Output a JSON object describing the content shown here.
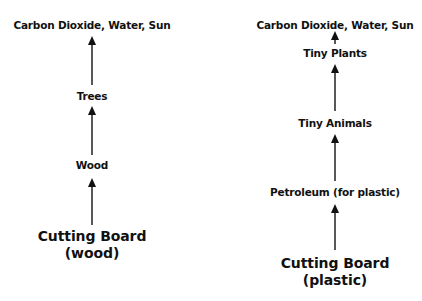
{
  "diagram": {
    "type": "flow",
    "direction": "bottom-to-top",
    "left_chain": {
      "nodes": [
        {
          "id": "co2",
          "label": "Carbon Dioxide, Water, Sun"
        },
        {
          "id": "trees",
          "label": "Trees"
        },
        {
          "id": "wood",
          "label": "Wood"
        },
        {
          "id": "board",
          "label_line1": "Cutting Board",
          "label_line2": "(wood)"
        }
      ],
      "edges": [
        {
          "from": "board",
          "to": "wood"
        },
        {
          "from": "wood",
          "to": "trees"
        },
        {
          "from": "trees",
          "to": "co2"
        }
      ]
    },
    "right_chain": {
      "nodes": [
        {
          "id": "co2",
          "label": "Carbon Dioxide, Water, Sun"
        },
        {
          "id": "plants",
          "label": "Tiny Plants"
        },
        {
          "id": "animals",
          "label": "Tiny Animals"
        },
        {
          "id": "petroleum",
          "label": "Petroleum (for plastic)"
        },
        {
          "id": "board",
          "label_line1": "Cutting Board",
          "label_line2": "(plastic)"
        }
      ],
      "edges": [
        {
          "from": "board",
          "to": "petroleum"
        },
        {
          "from": "petroleum",
          "to": "animals"
        },
        {
          "from": "animals",
          "to": "plants"
        },
        {
          "from": "plants",
          "to": "co2"
        }
      ]
    },
    "colors": {
      "text": "#111111",
      "arrow": "#111111",
      "background": "#ffffff"
    }
  }
}
